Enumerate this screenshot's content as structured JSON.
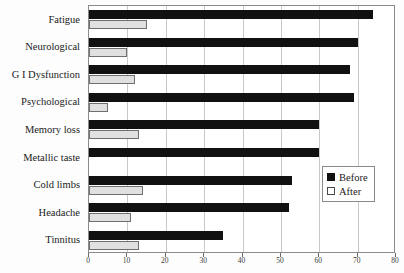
{
  "chart_data": {
    "type": "bar",
    "orientation": "horizontal",
    "title": "",
    "xlabel": "",
    "ylabel": "",
    "xlim": [
      0,
      80
    ],
    "xticks": [
      0,
      10,
      20,
      30,
      40,
      50,
      60,
      70,
      80
    ],
    "grid": true,
    "legend_position": "center-right",
    "categories": [
      "Fatigue",
      "Neurological",
      "G I Dysfunction",
      "Psychological",
      "Memory loss",
      "Metallic taste",
      "Cold limbs",
      "Headache",
      "Tinnitus"
    ],
    "series": [
      {
        "name": "Before",
        "color": "#111111",
        "values": [
          74,
          70,
          68,
          69,
          60,
          60,
          53,
          52,
          35
        ]
      },
      {
        "name": "After",
        "color": "#e0e0e0",
        "values": [
          15,
          10,
          12,
          5,
          13,
          0,
          14,
          11,
          13
        ]
      }
    ]
  },
  "legend": {
    "items": [
      {
        "label": "Before",
        "swatch": "filled-black-square"
      },
      {
        "label": "After",
        "swatch": "empty-white-square"
      }
    ]
  }
}
